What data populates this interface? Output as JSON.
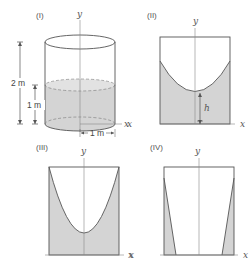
{
  "panels": [
    {
      "id": "I",
      "label": "(I)",
      "axis_y": "y",
      "axis_x": "x",
      "dimensions": {
        "total_height": "2 m",
        "water_height": "1 m",
        "radius": "1 m"
      }
    },
    {
      "id": "II",
      "label": "(II)",
      "axis_y": "y",
      "axis_x_left": "x",
      "axis_x_right": "x",
      "height_label": "h"
    },
    {
      "id": "III",
      "label": "(III)",
      "axis_y": "y",
      "axis_x": "x"
    },
    {
      "id": "IV",
      "label": "(IV)",
      "axis_y": "y",
      "axis_x_left": "x",
      "axis_x_right": "x"
    }
  ],
  "colors": {
    "fill": "#d4d4d4",
    "stroke": "#555555",
    "axis": "#888888"
  }
}
